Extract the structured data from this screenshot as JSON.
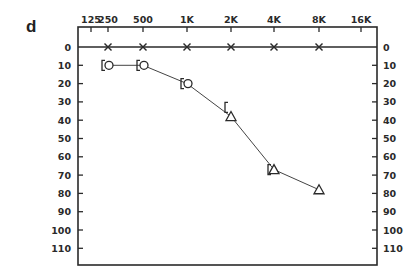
{
  "panel_label": "d",
  "chart_data": {
    "type": "line",
    "title": "",
    "chart_kind": "audiogram",
    "xlabel": "",
    "ylabel": "",
    "x_ticks": [
      "125",
      "250",
      "500",
      "1K",
      "2K",
      "4K",
      "8K",
      "16K"
    ],
    "y_ticks": [
      "0",
      "10",
      "20",
      "30",
      "40",
      "50",
      "60",
      "70",
      "80",
      "90",
      "100",
      "110"
    ],
    "ylim": [
      0,
      120
    ],
    "y_inverted": true,
    "grid": false,
    "reference_line": {
      "y": 0,
      "markers": "x",
      "x": [
        "250",
        "500",
        "1K",
        "2K",
        "4K",
        "8K"
      ]
    },
    "series": [
      {
        "name": "air conduction",
        "x": [
          "250",
          "500",
          "1K",
          "2K",
          "4K",
          "8K"
        ],
        "values": [
          10,
          10,
          20,
          38,
          67,
          78
        ],
        "markers": [
          "circle",
          "circle",
          "circle",
          "triangle",
          "triangle",
          "triangle"
        ],
        "connected": true
      },
      {
        "name": "bone conduction (masked)",
        "x": [
          "250",
          "500",
          "1K",
          "2K",
          "4K"
        ],
        "values": [
          10,
          10,
          20,
          33,
          67
        ],
        "markers": [
          "bracket",
          "bracket",
          "bracket",
          "bracket",
          "bracket"
        ],
        "connected": false
      }
    ]
  }
}
